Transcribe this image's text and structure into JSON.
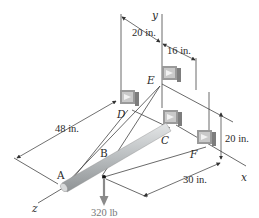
{
  "figure": {
    "type": "statics-3d-diagram",
    "points": {
      "A": "A",
      "B": "B",
      "C": "C",
      "D": "D",
      "E": "E",
      "F": "F"
    },
    "axes": {
      "x": "x",
      "y": "y",
      "z": "z"
    },
    "dimensions": {
      "d_20_top": "20 in.",
      "d_16": "16 in.",
      "d_48": "48 in.",
      "d_20_right": "20 in.",
      "d_30": "30 in."
    },
    "load": {
      "label": "320 lb",
      "direction": "down",
      "at_point": "B"
    },
    "colors": {
      "line": "#333333",
      "rod": "#b8bcbe",
      "bracket": "#a9a9a9",
      "load_arrow": "#8a8a8a"
    }
  }
}
